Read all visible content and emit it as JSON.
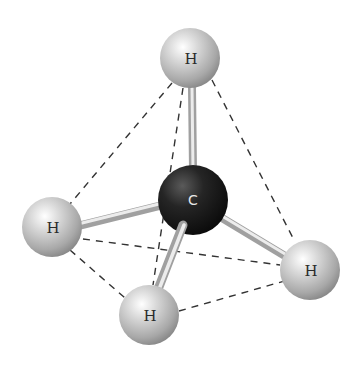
{
  "diagram": {
    "atoms": [
      {
        "id": "top-h",
        "label": "H",
        "x": 190,
        "y": 58,
        "r": 30
      },
      {
        "id": "carbon",
        "label": "C",
        "x": 193,
        "y": 200,
        "r": 35
      },
      {
        "id": "left-h",
        "label": "H",
        "x": 52,
        "y": 227,
        "r": 30
      },
      {
        "id": "right-h",
        "label": "H",
        "x": 310,
        "y": 270,
        "r": 30
      },
      {
        "id": "bottom-h",
        "label": "H",
        "x": 149,
        "y": 315,
        "r": 30
      }
    ],
    "bonds": [
      [
        "carbon",
        "top-h"
      ],
      [
        "carbon",
        "left-h"
      ],
      [
        "carbon",
        "right-h"
      ],
      [
        "carbon",
        "bottom-h"
      ]
    ],
    "tetrahedron_edges": [
      [
        "top-h",
        "left-h"
      ],
      [
        "top-h",
        "right-h"
      ],
      [
        "top-h",
        "bottom-h"
      ],
      [
        "left-h",
        "right-h"
      ],
      [
        "left-h",
        "bottom-h"
      ],
      [
        "bottom-h",
        "right-h"
      ]
    ],
    "colors": {
      "hydrogen": "#c8c8c8",
      "carbon": "#1a1a1a",
      "bond": "#d0d0d0",
      "dashed_edge": "#333333"
    }
  }
}
